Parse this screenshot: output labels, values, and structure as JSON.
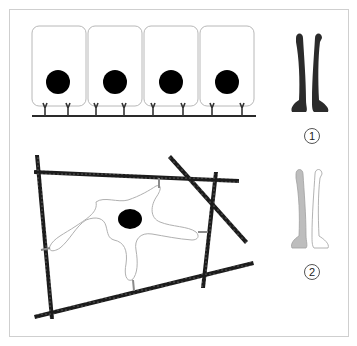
{
  "figure": {
    "frame": {
      "stroke": "#cfcfcf"
    },
    "epithelium": {
      "cell_count": 4,
      "cell_stroke": "#b8b8b8",
      "nucleus_color": "#000000",
      "basement_line_color": "#2a2a2a"
    },
    "fibroblast_mesh": {
      "fiber_color": "#1c1c1c",
      "cell_stroke": "#b0b0b0",
      "nucleus_color": "#000000",
      "adhesion_color": "#8a8a8a"
    },
    "legend": {
      "items": [
        {
          "label": "1",
          "fill": "#2b2b2b",
          "description": "dark paired structure"
        },
        {
          "label": "2",
          "fill_left": "#bdbdbd",
          "fill_right": "#ffffff",
          "description": "light paired structure"
        }
      ]
    }
  }
}
